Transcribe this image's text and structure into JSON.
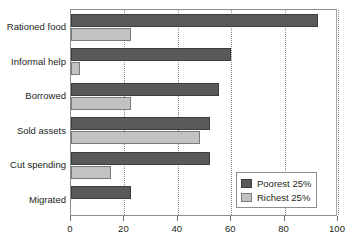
{
  "chart_data": {
    "type": "bar",
    "orientation": "horizontal",
    "title": "",
    "xlabel": "",
    "ylabel": "",
    "xlim": [
      0,
      100
    ],
    "ylim": null,
    "grid": true,
    "grid_axis": "x",
    "grid_style": "dotted",
    "legend_position": "bottom-right",
    "xticks": [
      0,
      20,
      40,
      60,
      80,
      100
    ],
    "xtick_labels": [
      "0",
      "20",
      "40",
      "60",
      "80",
      "100"
    ],
    "categories": [
      "Rationed food",
      "Informal help",
      "Borrowed",
      "Sold assets",
      "Cut spending",
      "Migrated"
    ],
    "series": [
      {
        "name": "Poorest 25%",
        "color": "#595959",
        "values": [
          92.5,
          60,
          55.5,
          52,
          52,
          22.5
        ]
      },
      {
        "name": "Richest 25%",
        "color": "#c2c2c2",
        "values": [
          22.5,
          3.5,
          22.5,
          48.5,
          15,
          0
        ]
      }
    ]
  },
  "legend": {
    "entries": [
      {
        "label": "Poorest 25%",
        "swatch": "poorest"
      },
      {
        "label": "Richest 25%",
        "swatch": "richest"
      }
    ]
  },
  "colors": {
    "poorest": "#595959",
    "richest": "#c2c2c2",
    "axis": "#8d8d8d",
    "grid": "#8a8a8a",
    "text": "#231f20",
    "background": "#ffffff"
  }
}
